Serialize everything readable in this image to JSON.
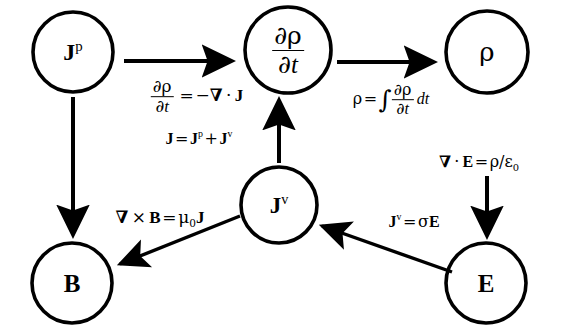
{
  "diagram": {
    "background_color": "#ffffff",
    "stroke_color": "#000000",
    "width": 568,
    "height": 333,
    "nodes": [
      {
        "id": "Jp",
        "label_html": "<span class=\"bf\">J</span><sup>p</sup>",
        "plain": "J^p",
        "cx": 73,
        "cy": 52,
        "r": 40,
        "font_size": 24
      },
      {
        "id": "drho_dt",
        "label_html": "frac",
        "plain": "∂ρ/∂t",
        "cx": 288,
        "cy": 50,
        "r": 43,
        "font_size": 24
      },
      {
        "id": "rho",
        "label_html": "<span class=\"sym\">ρ</span>",
        "plain": "ρ",
        "cx": 487,
        "cy": 52,
        "r": 41,
        "font_size": 25
      },
      {
        "id": "Jv",
        "label_html": "<span class=\"bf\">J</span><sup>v</sup>",
        "plain": "J^v",
        "cx": 279,
        "cy": 205,
        "r": 38,
        "font_size": 23
      },
      {
        "id": "B",
        "label_html": "<span class=\"bf\">B</span>",
        "plain": "B",
        "cx": 72,
        "cy": 283,
        "r": 40,
        "font_size": 25
      },
      {
        "id": "E",
        "label_html": "<span class=\"bf\">E</span>",
        "plain": "E",
        "cx": 486,
        "cy": 283,
        "r": 40,
        "font_size": 25
      }
    ],
    "edges": [
      {
        "id": "Jp-to-drho",
        "from": "Jp",
        "to": "drho_dt",
        "type": "arrow",
        "direction": "right"
      },
      {
        "id": "drho-to-rho",
        "from": "drho_dt",
        "to": "rho",
        "type": "arrow",
        "direction": "right"
      },
      {
        "id": "Jp-to-B",
        "from": "Jp",
        "to": "B",
        "type": "arrow",
        "direction": "down"
      },
      {
        "id": "rho-to-E",
        "from": "rho",
        "to": "E",
        "type": "arrow",
        "direction": "down"
      },
      {
        "id": "Jv-to-drho",
        "from": "Jv",
        "to": "drho_dt",
        "type": "arrow",
        "direction": "up"
      },
      {
        "id": "Jv-to-B",
        "from": "Jv",
        "to": "B",
        "type": "arrow",
        "direction": "diagonal-down-left"
      },
      {
        "id": "E-to-Jv",
        "from": "E",
        "to": "Jv",
        "type": "arrow",
        "direction": "diagonal-up-left"
      }
    ],
    "edge_labels": [
      {
        "id": "continuity-equation",
        "plain": "∂ρ/∂t = −∇ · J",
        "x": 197,
        "y": 97,
        "font_size": 17
      },
      {
        "id": "current-decomposition",
        "plain": "J = J^p + J^v",
        "x": 199,
        "y": 139,
        "font_size": 16
      },
      {
        "id": "charge-integral",
        "plain": "ρ = ∫ (∂ρ/∂t) dt",
        "x": 391,
        "y": 100,
        "font_size": 16
      },
      {
        "id": "gauss-law",
        "plain": "∇ · E = ρ/ε₀",
        "x": 479,
        "y": 162,
        "font_size": 16
      },
      {
        "id": "ampere-law",
        "plain": "∇ × B = μ₀ J",
        "x": 160,
        "y": 218,
        "font_size": 17
      },
      {
        "id": "ohms-law",
        "plain": "J^v = σE",
        "x": 414,
        "y": 222,
        "font_size": 16
      }
    ]
  }
}
